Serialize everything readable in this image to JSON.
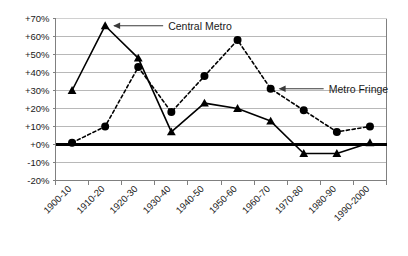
{
  "chart_data": {
    "type": "line",
    "title": "",
    "xlabel": "",
    "ylabel": "",
    "categories": [
      "1900-10",
      "1910-20",
      "1920-30",
      "1930-40",
      "1940-50",
      "1950-60",
      "1960-70",
      "1970-80",
      "1980-90",
      "1990-2000"
    ],
    "ylim": [
      -20,
      70
    ],
    "ytick_values": [
      70,
      60,
      50,
      40,
      30,
      20,
      10,
      0,
      -10,
      -20
    ],
    "ytick_labels": [
      "+70%",
      "+60%",
      "+50%",
      "+40%",
      "+30%",
      "+20%",
      "+10%",
      "+0%",
      "-10%",
      "-20%"
    ],
    "grid": true,
    "grid_axis": "y",
    "legend_position": "inline-annotations",
    "series": [
      {
        "name": "Central Metro",
        "values": [
          30,
          66,
          48,
          7,
          23,
          20,
          13,
          -5,
          -5,
          1
        ],
        "line_style": "solid",
        "marker": "triangle",
        "color": "#000000"
      },
      {
        "name": "Metro Fringe",
        "values": [
          1,
          10,
          43,
          18,
          38,
          58,
          31,
          19,
          7,
          10
        ],
        "line_style": "dashed",
        "marker": "circle",
        "color": "#000000"
      }
    ],
    "annotations": [
      {
        "id": "central-metro-callout",
        "label": "Central Metro",
        "points_to_category": "1910-20",
        "points_to_series": "Central Metro",
        "arrow_direction": "left"
      },
      {
        "id": "metro-fringe-callout",
        "label": "Metro Fringe",
        "points_to_category": "1960-70",
        "points_to_series": "Metro Fringe",
        "arrow_direction": "left"
      }
    ],
    "zero_line": {
      "value": 0,
      "emphasized": true,
      "color": "#000000"
    },
    "colors": {
      "grid": "#b8b8b8",
      "axis": "#808080",
      "series": "#000000",
      "background": "#ffffff",
      "text": "#1a1a1a"
    }
  }
}
